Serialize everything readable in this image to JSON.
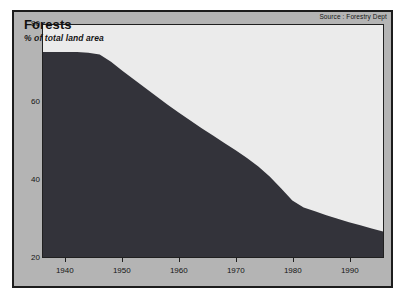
{
  "figure": {
    "source_note": "Source : Forestry Dept"
  },
  "chart_data": {
    "type": "area",
    "title": "Forests",
    "subtitle": "% of total land area",
    "xlabel": "",
    "ylabel": "",
    "xlim": [
      1936,
      1996
    ],
    "ylim": [
      20,
      80
    ],
    "grid": false,
    "legend": false,
    "fill_color": "#33333a",
    "plot_background": "#ebebeb",
    "panel_background": "#b4b4b4",
    "x_tick_labels": [
      "1940",
      "1950",
      "1960",
      "1970",
      "1980",
      "1990"
    ],
    "x_ticks": [
      1940,
      1950,
      1960,
      1970,
      1980,
      1990
    ],
    "y_tick_labels": [
      "80",
      "60",
      "40",
      "20"
    ],
    "y_ticks": [
      80,
      60,
      40,
      20
    ],
    "series": [
      {
        "name": "Forest cover",
        "units": "% of total land area",
        "x": [
          1936,
          1938,
          1940,
          1942,
          1944,
          1946,
          1948,
          1950,
          1952,
          1954,
          1956,
          1958,
          1960,
          1962,
          1964,
          1966,
          1968,
          1970,
          1972,
          1974,
          1976,
          1978,
          1980,
          1982,
          1984,
          1986,
          1988,
          1990,
          1992,
          1994,
          1996
        ],
        "values": [
          73.0,
          73.0,
          73.0,
          73.0,
          72.8,
          72.4,
          70.5,
          68.2,
          66.0,
          63.8,
          61.6,
          59.4,
          57.3,
          55.3,
          53.3,
          51.4,
          49.5,
          47.6,
          45.6,
          43.4,
          40.8,
          37.8,
          34.6,
          32.8,
          31.8,
          30.8,
          29.9,
          29.0,
          28.2,
          27.4,
          26.6
        ]
      }
    ]
  }
}
